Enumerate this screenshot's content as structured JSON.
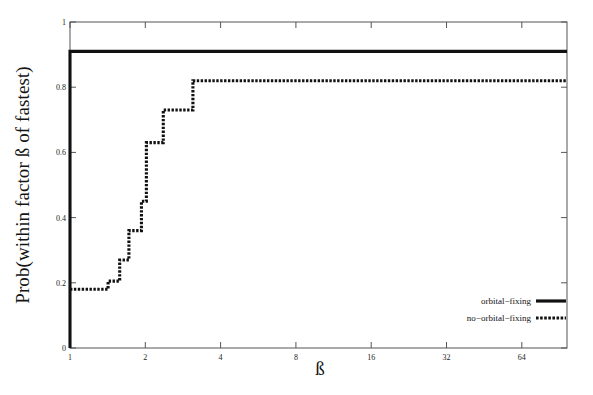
{
  "chart_data": {
    "type": "line",
    "title": "",
    "xlabel": "ß",
    "ylabel": "Prob(within factor ß of fastest)",
    "xscale": "log2",
    "xlim": [
      1,
      97
    ],
    "ylim": [
      0,
      1
    ],
    "grid": false,
    "xticks": [
      1,
      2,
      4,
      8,
      16,
      32,
      64
    ],
    "xtick_labels": [
      "1",
      "2",
      "4",
      "8",
      "16",
      "32",
      "64"
    ],
    "yticks": [
      0,
      0.2,
      0.4,
      0.6,
      0.8,
      1
    ],
    "ytick_labels": [
      "0",
      "0.2",
      "0.4",
      "0.6",
      "0.8",
      "1"
    ],
    "legend_position": "lower right",
    "series": [
      {
        "name": "orbital-fixing",
        "style": "solid",
        "color": "#111111",
        "step": "post",
        "x": [
          1,
          1,
          97
        ],
        "y": [
          0,
          0.91,
          0.91
        ]
      },
      {
        "name": "no-orbital-fixing",
        "style": "dotted",
        "color": "#111111",
        "step": "post",
        "x": [
          1,
          1.42,
          1.58,
          1.72,
          1.93,
          2.02,
          2.36,
          3.1,
          97
        ],
        "y": [
          0.18,
          0.205,
          0.27,
          0.36,
          0.45,
          0.63,
          0.73,
          0.82,
          0.82
        ]
      }
    ]
  },
  "legend": {
    "items": [
      {
        "label": "orbital−fixing",
        "style": "solid"
      },
      {
        "label": "no−orbital−fixing",
        "style": "dotted"
      }
    ]
  }
}
